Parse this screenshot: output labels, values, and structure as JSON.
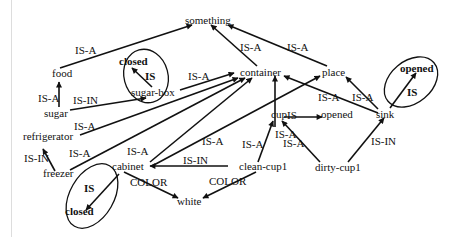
{
  "diagram": {
    "type": "semantic-network",
    "nodes": {
      "something": "something",
      "food": "food",
      "sugar": "sugar",
      "sugar_box": "sugar-box",
      "closed_top": "closed",
      "container": "container",
      "place": "place",
      "opened_sink": "opened",
      "sink": "sink",
      "refrigerator": "refrigerator",
      "freezer": "freezer",
      "cabinet": "cabinet",
      "cup": "cup",
      "opened_cup": "opened",
      "clean_cup1": "clean-cup1",
      "dirty_cup1": "dirty-cup1",
      "white": "white",
      "closed_cabinet": "closed"
    },
    "edge_labels": {
      "food_something": "IS-A",
      "sugar_food": "IS-A",
      "sugar_sugarbox": "IS-IN",
      "sugarbox_closed": "IS",
      "sugarbox_container": "IS-A",
      "container_something": "IS-A",
      "place_something": "IS-A",
      "refrigerator_container": "IS-A",
      "freezer_container": "IS-A",
      "freezer_refrigerator": "IS-IN",
      "cabinet_container": "IS-A",
      "cabinet_place": "IS-A",
      "cabinet_closed": "IS",
      "cabinet_white": "COLOR",
      "cup_container": "IS-A",
      "cup_opened": "IS",
      "sink_container": "IS-A",
      "sink_place": "IS-A",
      "sink_opened": "IS",
      "cleancup_cup": "IS-A",
      "cleancup_cabinet": "IS-IN",
      "cleancup_white": "COLOR",
      "dirtycup_cup": "IS-A",
      "dirtycup_sink": "IS-IN"
    },
    "edges": [
      {
        "from": "food",
        "to": "something",
        "label": "IS-A"
      },
      {
        "from": "container",
        "to": "something",
        "label": "IS-A"
      },
      {
        "from": "place",
        "to": "something",
        "label": "IS-A"
      },
      {
        "from": "sugar",
        "to": "food",
        "label": "IS-A"
      },
      {
        "from": "sugar",
        "to": "sugar-box",
        "label": "IS-IN"
      },
      {
        "from": "sugar-box",
        "to": "closed",
        "label": "IS"
      },
      {
        "from": "sugar-box",
        "to": "container",
        "label": "IS-A"
      },
      {
        "from": "refrigerator",
        "to": "container",
        "label": "IS-A"
      },
      {
        "from": "freezer",
        "to": "container",
        "label": "IS-A"
      },
      {
        "from": "freezer",
        "to": "refrigerator",
        "label": "IS-IN"
      },
      {
        "from": "cabinet",
        "to": "container",
        "label": "IS-A"
      },
      {
        "from": "cabinet",
        "to": "place",
        "label": "IS-A"
      },
      {
        "from": "cabinet",
        "to": "closed",
        "label": "IS"
      },
      {
        "from": "cabinet",
        "to": "white",
        "label": "COLOR"
      },
      {
        "from": "cup",
        "to": "container",
        "label": "IS-A"
      },
      {
        "from": "cup",
        "to": "opened",
        "label": "IS"
      },
      {
        "from": "sink",
        "to": "container",
        "label": "IS-A"
      },
      {
        "from": "sink",
        "to": "place",
        "label": "IS-A"
      },
      {
        "from": "sink",
        "to": "opened",
        "label": "IS"
      },
      {
        "from": "clean-cup1",
        "to": "cup",
        "label": "IS-A"
      },
      {
        "from": "clean-cup1",
        "to": "cabinet",
        "label": "IS-IN"
      },
      {
        "from": "clean-cup1",
        "to": "white",
        "label": "COLOR"
      },
      {
        "from": "dirty-cup1",
        "to": "cup",
        "label": "IS-A"
      },
      {
        "from": "dirty-cup1",
        "to": "sink",
        "label": "IS-IN"
      }
    ]
  }
}
